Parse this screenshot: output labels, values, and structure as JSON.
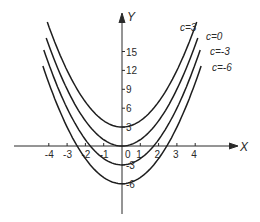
{
  "chart_data": {
    "type": "line",
    "title": "",
    "xlabel": "X",
    "ylabel": "Y",
    "equation": "y = x^2 + c",
    "xlim": [
      -4.5,
      4.5
    ],
    "ylim": [
      -9,
      20
    ],
    "grid": false,
    "x_ticks": [
      -4,
      -3,
      -2,
      -1,
      0,
      1,
      2,
      3,
      4
    ],
    "x_tick_labels": [
      "-4",
      "-3",
      "-2",
      "-1",
      "0",
      "1",
      "2",
      "3",
      "4"
    ],
    "y_ticks": [
      -6,
      -3,
      3,
      6,
      9,
      12,
      15
    ],
    "y_tick_labels": [
      "-6",
      "-3",
      "3",
      "6",
      "9",
      "12",
      "15"
    ],
    "series": [
      {
        "name": "c=3",
        "c": 3,
        "x": [
          -4,
          -3,
          -2,
          -1,
          0,
          1,
          2,
          3,
          4
        ],
        "values": [
          19,
          12,
          7,
          4,
          3,
          4,
          7,
          12,
          19
        ]
      },
      {
        "name": "c=0",
        "c": 0,
        "x": [
          -4,
          -3,
          -2,
          -1,
          0,
          1,
          2,
          3,
          4
        ],
        "values": [
          16,
          9,
          4,
          1,
          0,
          1,
          4,
          9,
          16
        ]
      },
      {
        "name": "c=-3",
        "c": -3,
        "x": [
          -4,
          -3,
          -2,
          -1,
          0,
          1,
          2,
          3,
          4
        ],
        "values": [
          13,
          6,
          1,
          -2,
          -3,
          -2,
          1,
          6,
          13
        ]
      },
      {
        "name": "c=-6",
        "c": -6,
        "x": [
          -4,
          -3,
          -2,
          -1,
          0,
          1,
          2,
          3,
          4
        ],
        "values": [
          10,
          3,
          -2,
          -5,
          -6,
          -5,
          -2,
          3,
          10
        ]
      }
    ],
    "legend": "curve labels at upper-right ends"
  },
  "labels": {
    "x_axis": "X",
    "y_axis": "Y",
    "curves": [
      "c=3",
      "c=0",
      "c=-3",
      "c=-6"
    ]
  }
}
